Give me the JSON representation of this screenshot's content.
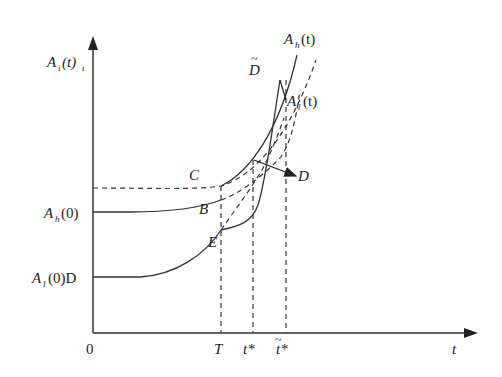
{
  "diagram": {
    "type": "economic-growth-curves",
    "axes": {
      "y_label_main": "A",
      "y_label_sub": "i",
      "y_label_rest": "(t)",
      "y_label_sub2": "t",
      "x_label": "t",
      "origin": "0"
    },
    "y_ticks": {
      "ah0_main": "A",
      "ah0_sub": "h",
      "ah0_rest": "(0)",
      "al0_main": "A",
      "al0_sub": "l",
      "al0_rest": "(0)D"
    },
    "x_ticks": {
      "T": "T",
      "tstar": "t*",
      "ttilde_star": "t*",
      "tilde": "~"
    },
    "curve_labels": {
      "ah_main": "A",
      "ah_sub": "h",
      "ah_rest": "(t)",
      "al_main": "A",
      "al_sub": "l",
      "al_rest": "(t)",
      "D_tilde": "D",
      "tilde": "~"
    },
    "points": {
      "C": "C",
      "B": "B",
      "E": "E",
      "D": "D"
    }
  }
}
